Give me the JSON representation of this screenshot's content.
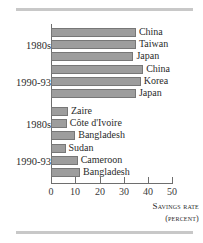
{
  "chart_data": {
    "type": "bar",
    "orientation": "horizontal",
    "title": "",
    "xlabel": "Savings rate",
    "xunit": "(percent)",
    "ylabel": "",
    "xlim": [
      0,
      52
    ],
    "grid": false,
    "legend": null,
    "xticks": [
      0,
      10,
      20,
      30,
      40,
      50
    ],
    "xticklabels": [
      "0",
      "10",
      "20",
      "30",
      "40",
      "50"
    ],
    "groups": [
      {
        "label": "1980s",
        "bars": [
          {
            "category": "China",
            "value": 35
          },
          {
            "category": "Taiwan",
            "value": 35
          },
          {
            "category": "Japan",
            "value": 34
          }
        ]
      },
      {
        "label": "1990-93",
        "bars": [
          {
            "category": "China",
            "value": 38
          },
          {
            "category": "Korea",
            "value": 37
          },
          {
            "category": "Japan",
            "value": 35
          }
        ]
      },
      {
        "label": "1980s",
        "bars": [
          {
            "category": "Zaire",
            "value": 7
          },
          {
            "category": "Côte d'Ivoire",
            "value": 6.5
          },
          {
            "category": "Bangladesh",
            "value": 10
          }
        ]
      },
      {
        "label": "1990-93",
        "bars": [
          {
            "category": "Sudan",
            "value": 6
          },
          {
            "category": "Cameroon",
            "value": 11
          },
          {
            "category": "Bangladesh",
            "value": 12
          }
        ]
      }
    ],
    "categories": [
      "China",
      "Taiwan",
      "Japan",
      "China",
      "Korea",
      "Japan",
      "Zaire",
      "Côte d'Ivoire",
      "Bangladesh",
      "Sudan",
      "Cameroon",
      "Bangladesh"
    ],
    "values": [
      35,
      35,
      34,
      38,
      37,
      35,
      7,
      6.5,
      10,
      6,
      11,
      12
    ],
    "colors": {
      "bar_fill": "#9d9d9d",
      "bar_stroke": "#777777",
      "axis": "#6e6e6e",
      "text": "#2b2b2b",
      "rule": "#c8c8c8",
      "background": "#ffffff"
    }
  }
}
